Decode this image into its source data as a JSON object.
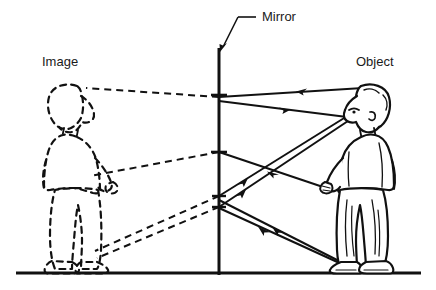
{
  "diagram": {
    "title_text": "",
    "type": "optics-ray-diagram-plane-mirror",
    "ink_color": "#111111",
    "background_color": "#ffffff",
    "labels": {
      "image": "Image",
      "mirror": "Mirror",
      "object": "Object"
    },
    "label_positions": {
      "image": {
        "x": 42,
        "y": 66
      },
      "mirror": {
        "x": 262,
        "y": 21
      },
      "object": {
        "x": 356,
        "y": 66
      }
    },
    "mirror_line": {
      "x": 219,
      "y_top": 48,
      "y_bottom": 275
    },
    "ground_line": {
      "x_left": 16,
      "x_right": 421,
      "y": 273
    },
    "mirror_leader": {
      "label_end": {
        "x": 256,
        "y": 17
      },
      "bend": {
        "x": 238,
        "y": 17
      },
      "arrow_tip": {
        "x": 221,
        "y": 50
      }
    },
    "reflection_points": [
      {
        "name": "head-ray-hit",
        "x": 219,
        "y": 95
      },
      {
        "name": "eye-ray-hit",
        "x": 219,
        "y": 100
      },
      {
        "name": "mid-ray-hit",
        "x": 219,
        "y": 152
      },
      {
        "name": "foot-ray-hit-upper",
        "x": 219,
        "y": 196
      },
      {
        "name": "foot-ray-hit-lower",
        "x": 219,
        "y": 207
      }
    ],
    "eye_point": {
      "x": 349,
      "y": 113
    },
    "rays": [
      {
        "name": "incident-ray-from-head",
        "direction": "toward-mirror",
        "from": {
          "x": 362,
          "y": 88
        },
        "to": {
          "x": 219,
          "y": 97
        },
        "arrow_at": 0.45,
        "arrow_dir": "left"
      },
      {
        "name": "reflected-ray-to-eye-upper",
        "direction": "toward-eye",
        "from": {
          "x": 219,
          "y": 100
        },
        "to": {
          "x": 347,
          "y": 117
        },
        "arrow_at": 0.45,
        "arrow_dir": "right"
      },
      {
        "name": "incident-ray-from-hand",
        "direction": "toward-mirror",
        "from": {
          "x": 325,
          "y": 187
        },
        "to": {
          "x": 219,
          "y": 152
        },
        "arrow_at": 0.55,
        "arrow_dir": "left"
      },
      {
        "name": "reflected-ray-mid-to-eye",
        "direction": "toward-eye",
        "from": {
          "x": 219,
          "y": 196
        },
        "to": {
          "x": 349,
          "y": 114
        },
        "arrow_at": 0.25,
        "arrow_dir": "right"
      },
      {
        "name": "incident-ray-from-foot",
        "direction": "toward-mirror",
        "from": {
          "x": 340,
          "y": 262
        },
        "to": {
          "x": 219,
          "y": 200
        },
        "arrow_at": 0.5,
        "arrow_dir": "left"
      },
      {
        "name": "reflected-ray-foot-to-eye",
        "direction": "toward-eye",
        "from": {
          "x": 219,
          "y": 207
        },
        "to": {
          "x": 351,
          "y": 118
        },
        "arrow_at": 0.22,
        "arrow_dir": "right"
      },
      {
        "name": "incident-ray-from-foot-2",
        "direction": "toward-mirror",
        "from": {
          "x": 345,
          "y": 265
        },
        "to": {
          "x": 219,
          "y": 208
        },
        "arrow_at": 0.52,
        "arrow_dir": "left"
      }
    ],
    "virtual_rays": [
      {
        "name": "virtual-ray-head",
        "from": {
          "x": 219,
          "y": 97
        },
        "to": {
          "x": 88,
          "y": 88
        },
        "style": "dashed"
      },
      {
        "name": "virtual-ray-mid",
        "from": {
          "x": 219,
          "y": 152
        },
        "to": {
          "x": 92,
          "y": 175
        },
        "style": "dashed"
      },
      {
        "name": "virtual-ray-foot-upper",
        "from": {
          "x": 219,
          "y": 196
        },
        "to": {
          "x": 96,
          "y": 250
        },
        "style": "dashed"
      },
      {
        "name": "virtual-ray-foot-lower",
        "from": {
          "x": 219,
          "y": 207
        },
        "to": {
          "x": 98,
          "y": 257
        },
        "style": "dashed"
      }
    ],
    "figures": [
      {
        "name": "object-boy",
        "style": "solid-outline",
        "description": "boy standing facing left toward the mirror, hands in pockets"
      },
      {
        "name": "image-boy",
        "style": "dashed-outline",
        "description": "mirror image of the boy, dashed, facing right"
      }
    ],
    "mirror_ticks": [
      {
        "x": 219,
        "y": 95,
        "width": 16
      },
      {
        "x": 219,
        "y": 152,
        "width": 16
      },
      {
        "x": 219,
        "y": 196,
        "width": 14
      },
      {
        "x": 219,
        "y": 207,
        "width": 14
      }
    ]
  }
}
